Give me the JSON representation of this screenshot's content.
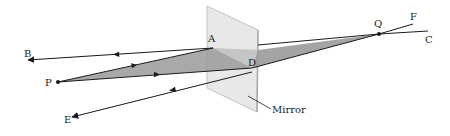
{
  "diagram": {
    "type": "ray-optics",
    "colors": {
      "ray": "#1a1a1a",
      "cone_fill": "#9a9a9a",
      "mirror_fill": "#e4e4e4",
      "mirror_edge": "#b5b5b5",
      "background": "#ffffff"
    },
    "points": {
      "P": {
        "label": "P",
        "x": 58,
        "y": 82
      },
      "A": {
        "label": "A",
        "x": 213,
        "y": 48
      },
      "D": {
        "label": "D",
        "x": 252,
        "y": 68
      },
      "Q": {
        "label": "Q",
        "x": 379,
        "y": 34
      },
      "B": {
        "label": "B",
        "x": 28,
        "y": 60
      },
      "E": {
        "label": "E",
        "x": 72,
        "y": 117
      },
      "F": {
        "label": "F",
        "x": 413,
        "y": 24
      },
      "C": {
        "label": "C",
        "x": 428,
        "y": 31
      }
    },
    "mirror": {
      "label": "Mirror"
    },
    "rays": [
      {
        "from": "P",
        "to": "A",
        "arrow": "forward"
      },
      {
        "from": "P",
        "to": "D",
        "arrow": "forward"
      },
      {
        "from": "A",
        "to": "B",
        "arrow": "forward"
      },
      {
        "from": "D",
        "to": "E",
        "arrow": "forward"
      },
      {
        "from": "A",
        "to": "Q",
        "style": "construction"
      },
      {
        "from": "D",
        "to": "Q",
        "style": "construction"
      },
      {
        "from": "Q",
        "to": "F",
        "style": "extension"
      },
      {
        "from": "Q",
        "to": "C",
        "style": "extension"
      }
    ]
  }
}
